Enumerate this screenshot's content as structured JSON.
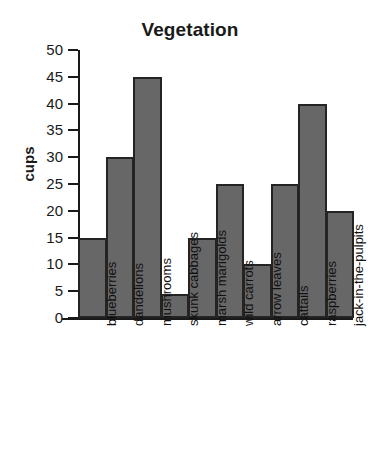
{
  "chart_data": {
    "type": "bar",
    "title": "Vegetation",
    "xlabel": "",
    "ylabel": "cups",
    "categories": [
      "blueberries",
      "dandelions",
      "mushrooms",
      "skunk cabbages",
      "marsh marigolds",
      "wild carrots",
      "arrow leaves",
      "cattails",
      "raspberries",
      "jack-in-the-pulpits"
    ],
    "values": [
      15,
      30,
      45,
      4.5,
      15,
      25,
      10,
      25,
      40,
      20
    ],
    "ylim": [
      0,
      50
    ],
    "yticks": [
      0,
      5,
      10,
      15,
      20,
      25,
      30,
      35,
      40,
      45,
      50
    ],
    "ytick_labels": [
      "0",
      "5",
      "10",
      "15",
      "20",
      "25",
      "30",
      "35",
      "40",
      "45",
      "50"
    ],
    "grid": false,
    "legend": null,
    "bar_color": "#676767",
    "bar_edge_color": "#242424",
    "axis_color": "#1a1a1a",
    "background": "#ffffff"
  }
}
